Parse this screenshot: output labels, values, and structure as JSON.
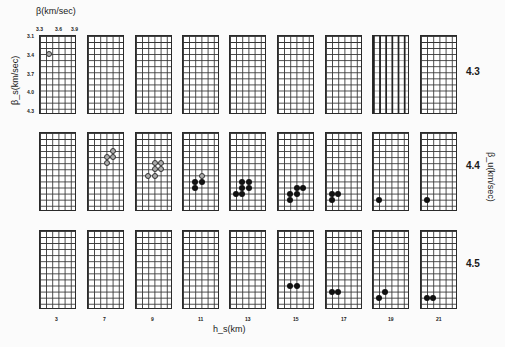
{
  "chart_data": {
    "type": "scatter",
    "title": "",
    "layout": "grid of small panels: 3 rows (beta_u) x 9 columns (h_s)",
    "xlabel": "h_s(km)",
    "panel_xlabel": "β(km/sec)",
    "panel_ylabel": "β_s(km/sec)",
    "row_axis_label": "β_u(km/sec)",
    "panel_x_ticks": [
      "3.3",
      "3.6",
      "3.9"
    ],
    "panel_y_ticks": [
      "3.1",
      "3.4",
      "3.7",
      "4.0",
      "4.3"
    ],
    "columns": [
      "3",
      "7",
      "9",
      "11",
      "13",
      "15",
      "17",
      "19",
      "21"
    ],
    "rows": [
      "4.3",
      "4.4",
      "4.5"
    ],
    "grid": {
      "cols": 6,
      "rows": 13
    },
    "panels": [
      {
        "row": "4.3",
        "h_s": "3",
        "points": [
          {
            "c": 1.5,
            "r": 3,
            "style": "open"
          }
        ]
      },
      {
        "row": "4.3",
        "h_s": "7",
        "points": []
      },
      {
        "row": "4.3",
        "h_s": "9",
        "points": []
      },
      {
        "row": "4.3",
        "h_s": "11",
        "points": []
      },
      {
        "row": "4.3",
        "h_s": "13",
        "points": []
      },
      {
        "row": "4.3",
        "h_s": "15",
        "points": []
      },
      {
        "row": "4.3",
        "h_s": "17",
        "points": []
      },
      {
        "row": "4.3",
        "h_s": "19",
        "points": []
      },
      {
        "row": "4.3",
        "h_s": "21",
        "points": []
      },
      {
        "row": "4.4",
        "h_s": "3",
        "points": []
      },
      {
        "row": "4.4",
        "h_s": "7",
        "points": [
          {
            "c": 4,
            "r": 3,
            "style": "open"
          },
          {
            "c": 3,
            "r": 4,
            "style": "open"
          },
          {
            "c": 4,
            "r": 4,
            "style": "open"
          },
          {
            "c": 3,
            "r": 5,
            "style": "open"
          }
        ]
      },
      {
        "row": "4.4",
        "h_s": "9",
        "points": [
          {
            "c": 3,
            "r": 5,
            "style": "open"
          },
          {
            "c": 4,
            "r": 5,
            "style": "open"
          },
          {
            "c": 3,
            "r": 6,
            "style": "open"
          },
          {
            "c": 4,
            "r": 6,
            "style": "open"
          },
          {
            "c": 2,
            "r": 7,
            "style": "open"
          },
          {
            "c": 3,
            "r": 7,
            "style": "open"
          }
        ]
      },
      {
        "row": "4.4",
        "h_s": "11",
        "points": [
          {
            "c": 3,
            "r": 7,
            "style": "open"
          },
          {
            "c": 2,
            "r": 8,
            "style": "filled"
          },
          {
            "c": 3,
            "r": 8,
            "style": "filled"
          },
          {
            "c": 2,
            "r": 9,
            "style": "filled"
          }
        ]
      },
      {
        "row": "4.4",
        "h_s": "13",
        "points": [
          {
            "c": 2,
            "r": 8,
            "style": "filled"
          },
          {
            "c": 3,
            "r": 8,
            "style": "filled"
          },
          {
            "c": 2,
            "r": 9,
            "style": "filled"
          },
          {
            "c": 3,
            "r": 9,
            "style": "filled"
          },
          {
            "c": 1,
            "r": 10,
            "style": "filled"
          },
          {
            "c": 2,
            "r": 10,
            "style": "filled"
          }
        ]
      },
      {
        "row": "4.4",
        "h_s": "15",
        "points": [
          {
            "c": 3,
            "r": 9,
            "style": "filled"
          },
          {
            "c": 4,
            "r": 9,
            "style": "filled"
          },
          {
            "c": 2,
            "r": 10,
            "style": "filled"
          },
          {
            "c": 3,
            "r": 10,
            "style": "filled"
          },
          {
            "c": 2,
            "r": 11,
            "style": "filled"
          }
        ]
      },
      {
        "row": "4.4",
        "h_s": "17",
        "points": [
          {
            "c": 1,
            "r": 10,
            "style": "filled"
          },
          {
            "c": 2,
            "r": 10,
            "style": "filled"
          },
          {
            "c": 1,
            "r": 11,
            "style": "filled"
          }
        ]
      },
      {
        "row": "4.4",
        "h_s": "19",
        "points": [
          {
            "c": 1,
            "r": 11,
            "style": "filled"
          }
        ]
      },
      {
        "row": "4.4",
        "h_s": "21",
        "points": [
          {
            "c": 1,
            "r": 11,
            "style": "filled"
          }
        ]
      },
      {
        "row": "4.5",
        "h_s": "3",
        "points": []
      },
      {
        "row": "4.5",
        "h_s": "7",
        "points": []
      },
      {
        "row": "4.5",
        "h_s": "9",
        "points": []
      },
      {
        "row": "4.5",
        "h_s": "11",
        "points": []
      },
      {
        "row": "4.5",
        "h_s": "13",
        "points": []
      },
      {
        "row": "4.5",
        "h_s": "15",
        "points": [
          {
            "c": 2,
            "r": 9,
            "style": "filled"
          },
          {
            "c": 3,
            "r": 9,
            "style": "filled"
          }
        ]
      },
      {
        "row": "4.5",
        "h_s": "17",
        "points": [
          {
            "c": 1,
            "r": 10,
            "style": "filled"
          },
          {
            "c": 2,
            "r": 10,
            "style": "filled"
          }
        ]
      },
      {
        "row": "4.5",
        "h_s": "19",
        "points": [
          {
            "c": 2,
            "r": 10,
            "style": "filled"
          },
          {
            "c": 1,
            "r": 11,
            "style": "filled"
          }
        ]
      },
      {
        "row": "4.5",
        "h_s": "21",
        "points": [
          {
            "c": 1,
            "r": 11,
            "style": "filled"
          },
          {
            "c": 2,
            "r": 11,
            "style": "filled"
          }
        ]
      }
    ]
  }
}
